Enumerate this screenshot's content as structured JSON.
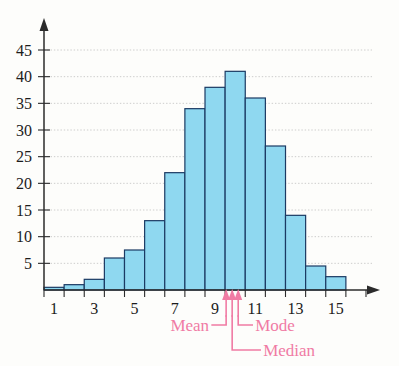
{
  "chart_data": {
    "type": "bar",
    "title": "",
    "subtitle": "",
    "xlabel": "",
    "ylabel": "",
    "categories": [
      1,
      2,
      3,
      4,
      5,
      6,
      7,
      8,
      9,
      10,
      11,
      12,
      13,
      14,
      15,
      16
    ],
    "values": [
      0.5,
      1,
      2,
      6,
      7.5,
      13,
      22,
      34,
      38,
      41,
      36,
      27,
      14,
      4.5,
      2.5,
      0
    ],
    "x_tick_labels": [
      "1",
      "3",
      "5",
      "7",
      "9",
      "11",
      "13",
      "15"
    ],
    "x_tick_values": [
      1,
      3,
      5,
      7,
      9,
      11,
      13,
      15
    ],
    "y_tick_labels": [
      "5",
      "10",
      "15",
      "20",
      "25",
      "30",
      "35",
      "40",
      "45"
    ],
    "y_tick_values": [
      5,
      10,
      15,
      20,
      25,
      30,
      35,
      40,
      45
    ],
    "xlim": [
      0.5,
      16.5
    ],
    "ylim": [
      0,
      48
    ],
    "grid": true,
    "legend_position": "none",
    "bar_fill": "#8fd8f0",
    "bar_stroke": "#1b3a63",
    "annotation_color": "#f07ba4",
    "annotations": [
      {
        "label": "Mean",
        "x": 9.55
      },
      {
        "label": "Median",
        "x": 9.85
      },
      {
        "label": "Mode",
        "x": 10.15
      }
    ]
  },
  "labels": {
    "mean": "Mean",
    "median": "Median",
    "mode": "Mode"
  }
}
